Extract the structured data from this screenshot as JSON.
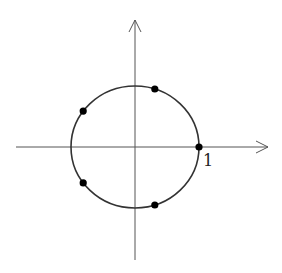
{
  "diagram": {
    "title": "",
    "colors": {
      "stroke": "#333333",
      "axis": "#555555",
      "dot": "#000000",
      "background": "#ffffff"
    },
    "axes": {
      "origin_px": [
        135,
        147
      ],
      "x_axis": {
        "start_px": [
          16,
          147
        ],
        "end_px": [
          268,
          147
        ],
        "arrow": true
      },
      "y_axis": {
        "start_px": [
          135,
          260
        ],
        "end_px": [
          135,
          20
        ],
        "arrow": true
      }
    },
    "circle": {
      "center_px": [
        135,
        147
      ],
      "rx_px": 64,
      "ry_px": 61,
      "radius_units": 1
    },
    "labels": {
      "unit_mark": "1"
    },
    "points": [
      {
        "name": "root-0",
        "angle_deg": 0,
        "px": [
          199,
          147
        ]
      },
      {
        "name": "root-1",
        "angle_deg": 72,
        "px": [
          155,
          89
        ]
      },
      {
        "name": "root-2",
        "angle_deg": 144,
        "px": [
          83,
          111
        ]
      },
      {
        "name": "root-3",
        "angle_deg": 216,
        "px": [
          83,
          183
        ]
      },
      {
        "name": "root-4",
        "angle_deg": 288,
        "px": [
          155,
          205
        ]
      }
    ]
  }
}
